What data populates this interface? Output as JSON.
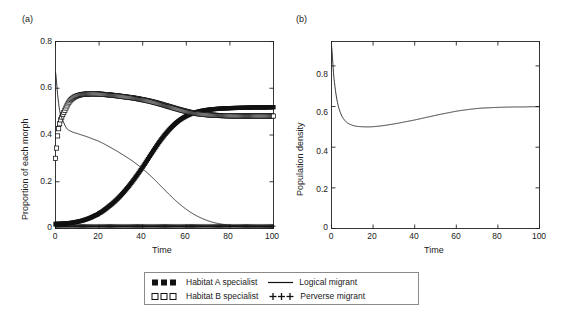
{
  "figure": {
    "panels": [
      {
        "label": "(a)",
        "ylabel": "Proportion of each morph",
        "xlabel": "Time"
      },
      {
        "label": "(b)",
        "ylabel": "Population density",
        "xlabel": "Time"
      }
    ]
  },
  "legend": {
    "items": [
      {
        "marker": "filled-square-series",
        "label": "Habitat A specialist"
      },
      {
        "marker": "line-series",
        "label": "Logical migrant"
      },
      {
        "marker": "open-square-series",
        "label": "Habitat B specialist"
      },
      {
        "marker": "plus-series",
        "label": "Perverse migrant"
      }
    ]
  },
  "chart_data": [
    {
      "type": "line",
      "panel": "(a)",
      "title": "",
      "xlabel": "Time",
      "ylabel": "Proportion of each morph",
      "xlim": [
        0,
        100
      ],
      "ylim": [
        0,
        0.8
      ],
      "xticks": [
        0,
        20,
        40,
        60,
        80,
        100
      ],
      "yticks": [
        0,
        0.2,
        0.4,
        0.6,
        0.8
      ],
      "xtick_labels": [
        "0",
        "20",
        "40",
        "60",
        "80",
        "100"
      ],
      "ytick_labels": [
        "0",
        "0.2",
        "0.4",
        "0.6",
        "0.8"
      ],
      "grid": false,
      "legend_position": "below-figure",
      "x": [
        0,
        1,
        2,
        3,
        4,
        5,
        6,
        7,
        8,
        9,
        10,
        12,
        14,
        16,
        18,
        20,
        24,
        28,
        32,
        36,
        40,
        44,
        48,
        52,
        56,
        60,
        64,
        68,
        72,
        76,
        80,
        84,
        88,
        92,
        96,
        100
      ],
      "series": [
        {
          "name": "Habitat A specialist",
          "marker": "filled-square",
          "values": [
            0.02,
            0.02,
            0.02,
            0.021,
            0.021,
            0.022,
            0.023,
            0.024,
            0.025,
            0.027,
            0.029,
            0.033,
            0.039,
            0.046,
            0.055,
            0.065,
            0.091,
            0.123,
            0.163,
            0.21,
            0.263,
            0.32,
            0.375,
            0.421,
            0.457,
            0.481,
            0.496,
            0.505,
            0.51,
            0.513,
            0.515,
            0.516,
            0.517,
            0.518,
            0.518,
            0.519
          ]
        },
        {
          "name": "Habitat B specialist",
          "marker": "open-square",
          "values": [
            0.3,
            0.4,
            0.452,
            0.48,
            0.5,
            0.52,
            0.538,
            0.55,
            0.558,
            0.564,
            0.568,
            0.573,
            0.575,
            0.576,
            0.576,
            0.575,
            0.572,
            0.568,
            0.563,
            0.558,
            0.551,
            0.543,
            0.533,
            0.522,
            0.511,
            0.501,
            0.493,
            0.488,
            0.485,
            0.483,
            0.482,
            0.481,
            0.481,
            0.481,
            0.481,
            0.481
          ]
        },
        {
          "name": "Logical migrant",
          "marker": "line",
          "values": [
            0.67,
            0.57,
            0.5,
            0.47,
            0.448,
            0.43,
            0.421,
            0.416,
            0.412,
            0.409,
            0.406,
            0.4,
            0.394,
            0.387,
            0.38,
            0.372,
            0.353,
            0.332,
            0.309,
            0.284,
            0.255,
            0.222,
            0.185,
            0.147,
            0.112,
            0.082,
            0.058,
            0.04,
            0.027,
            0.019,
            0.014,
            0.01,
            0.008,
            0.007,
            0.006,
            0.006
          ]
        },
        {
          "name": "Perverse migrant",
          "marker": "plus",
          "values": [
            0.01,
            0.01,
            0.01,
            0.01,
            0.01,
            0.01,
            0.01,
            0.01,
            0.01,
            0.01,
            0.01,
            0.01,
            0.01,
            0.01,
            0.01,
            0.01,
            0.01,
            0.01,
            0.01,
            0.01,
            0.01,
            0.01,
            0.01,
            0.01,
            0.01,
            0.01,
            0.01,
            0.01,
            0.01,
            0.01,
            0.01,
            0.01,
            0.01,
            0.01,
            0.01,
            0.01
          ]
        }
      ]
    },
    {
      "type": "line",
      "panel": "(b)",
      "title": "",
      "xlabel": "Time",
      "ylabel": "Population density",
      "xlim": [
        0,
        100
      ],
      "ylim": [
        0,
        0.92
      ],
      "xticks": [
        0,
        20,
        40,
        60,
        80,
        100
      ],
      "yticks": [
        0,
        0.2,
        0.4,
        0.6,
        0.8
      ],
      "xtick_labels": [
        "0",
        "20",
        "40",
        "60",
        "80",
        "100"
      ],
      "ytick_labels": [
        "0",
        "0.2",
        "0.4",
        "0.6",
        "0.8"
      ],
      "grid": false,
      "x": [
        0,
        1,
        2,
        3,
        4,
        5,
        6,
        7,
        8,
        10,
        12,
        14,
        16,
        18,
        20,
        24,
        28,
        32,
        36,
        40,
        44,
        48,
        52,
        56,
        60,
        64,
        68,
        72,
        76,
        80,
        84,
        88,
        92,
        96,
        100
      ],
      "series": [
        {
          "name": "Population density",
          "marker": "line",
          "values": [
            0.9,
            0.76,
            0.672,
            0.614,
            0.578,
            0.553,
            0.537,
            0.525,
            0.517,
            0.508,
            0.503,
            0.501,
            0.5,
            0.5,
            0.501,
            0.505,
            0.511,
            0.518,
            0.526,
            0.534,
            0.543,
            0.552,
            0.561,
            0.569,
            0.577,
            0.583,
            0.588,
            0.592,
            0.594,
            0.596,
            0.597,
            0.598,
            0.598,
            0.599,
            0.599
          ]
        }
      ]
    }
  ]
}
